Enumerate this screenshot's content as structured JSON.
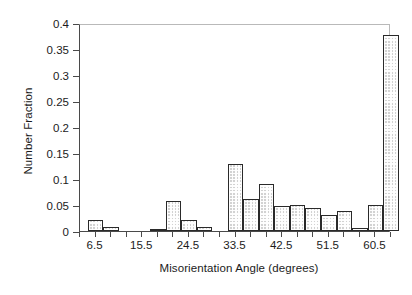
{
  "chart_data": {
    "type": "bar",
    "title": "",
    "xlabel": "Misorientation Angle (degrees)",
    "ylabel": "Number Fraction",
    "xlim": [
      3.5,
      63.5
    ],
    "ylim": [
      0,
      0.4
    ],
    "grid": false,
    "legend": null,
    "bin_width": 3,
    "x_tick_labels": [
      "6.5",
      "15.5",
      "24.5",
      "33.5",
      "42.5",
      "51.5",
      "60.5"
    ],
    "x_tick_values": [
      6.5,
      15.5,
      24.5,
      33.5,
      42.5,
      51.5,
      60.5
    ],
    "y_tick_labels": [
      "0",
      "0.05",
      "0.1",
      "0.15",
      "0.2",
      "0.25",
      "0.3",
      "0.35",
      "0.4"
    ],
    "y_tick_values": [
      0,
      0.05,
      0.1,
      0.15,
      0.2,
      0.25,
      0.3,
      0.35,
      0.4
    ],
    "categories": [
      6.5,
      9.5,
      12.5,
      15.5,
      18.5,
      21.5,
      24.5,
      27.5,
      30.5,
      33.5,
      36.5,
      39.5,
      42.5,
      45.5,
      48.5,
      51.5,
      54.5,
      57.5,
      60.5,
      63.5
    ],
    "values": [
      0.022,
      0.007,
      0.0,
      0.0,
      0.004,
      0.057,
      0.021,
      0.008,
      0.0,
      0.129,
      0.061,
      0.091,
      0.048,
      0.05,
      0.045,
      0.031,
      0.038,
      0.006,
      0.05,
      0.376
    ],
    "bar_color": "#d2d2d2",
    "bar_edge_color": "#2a2a2a",
    "axis_color": "#4a4a4a"
  }
}
